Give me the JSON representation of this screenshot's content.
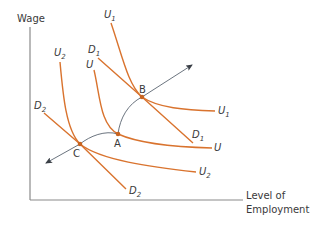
{
  "axes": {
    "y_label": "Wage",
    "x_label_line1": "Level of",
    "x_label_line2": "Employment"
  },
  "curves": {
    "U1": {
      "main": "U",
      "sub": "1"
    },
    "U": {
      "main": "U",
      "sub": ""
    },
    "U2": {
      "main": "U",
      "sub": "2"
    },
    "D1": {
      "main": "D",
      "sub": "1"
    },
    "D2": {
      "main": "D",
      "sub": "2"
    }
  },
  "points": {
    "A": "A",
    "B": "B",
    "C": "C"
  },
  "colors": {
    "curve": "#d9732e",
    "axis": "#8a8a8a",
    "path": "#5a6470",
    "text": "#3a3a3a"
  }
}
